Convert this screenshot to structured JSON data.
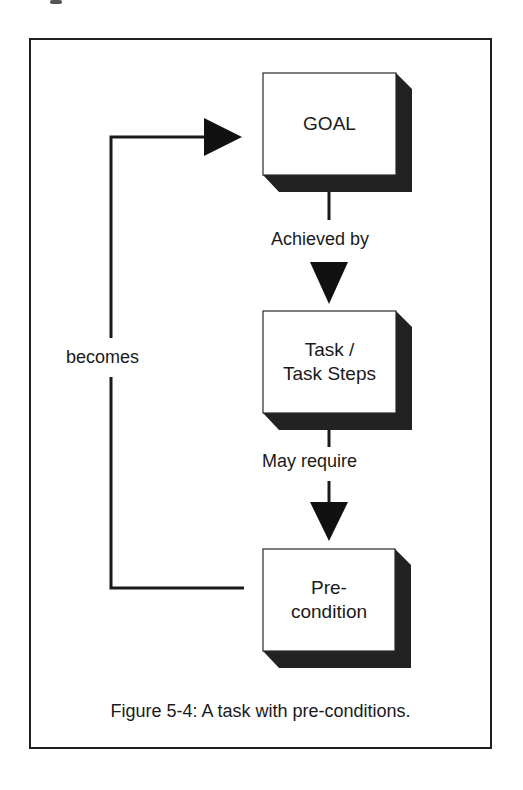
{
  "figure": {
    "caption": "Figure 5-4: A task with pre-conditions.",
    "colors": {
      "ink": "#1a1a1a",
      "shadow": "#222222",
      "background": "#ffffff"
    }
  },
  "nodes": [
    {
      "id": "goal",
      "label": "GOAL"
    },
    {
      "id": "task",
      "label": "Task /\nTask Steps"
    },
    {
      "id": "precondition",
      "label": "Pre-\ncondition"
    }
  ],
  "edges": [
    {
      "from": "goal",
      "to": "task",
      "label": "Achieved by"
    },
    {
      "from": "task",
      "to": "precondition",
      "label": "May require"
    },
    {
      "from": "precondition",
      "to": "goal",
      "label": "becomes"
    }
  ]
}
